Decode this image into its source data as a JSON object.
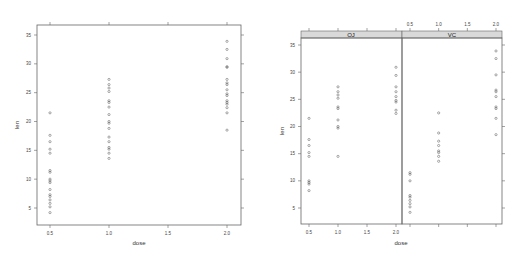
{
  "chart_data": [
    {
      "type": "scatter",
      "title": "",
      "xlabel": "dose",
      "ylabel": "len",
      "xlim": [
        0.4,
        2.1
      ],
      "ylim": [
        2.5,
        36
      ],
      "x_ticks": [
        "0.5",
        "1.0",
        "1.5",
        "2.0"
      ],
      "y_ticks": [
        "5",
        "10",
        "15",
        "20",
        "25",
        "30",
        "35"
      ],
      "grid": false,
      "series": [
        {
          "name": "all",
          "points": {
            "0.5": [
              4.2,
              5.2,
              5.8,
              6.4,
              7.0,
              7.3,
              8.2,
              9.4,
              9.7,
              10.0,
              11.2,
              11.5,
              14.5,
              15.2,
              16.5,
              17.6,
              21.5
            ],
            "1.0": [
              13.6,
              14.5,
              15.2,
              15.5,
              16.5,
              17.3,
              18.8,
              19.7,
              20.0,
              21.2,
              22.5,
              23.3,
              23.6,
              25.2,
              25.8,
              26.4,
              27.3
            ],
            "2.0": [
              18.5,
              21.5,
              22.4,
              23.0,
              23.3,
              23.6,
              24.5,
              24.8,
              25.5,
              26.4,
              26.7,
              27.3,
              29.4,
              29.5,
              30.9,
              32.5,
              33.9
            ]
          }
        }
      ]
    },
    {
      "type": "scatter",
      "title": "",
      "xlabel": "dose",
      "ylabel": "len",
      "xlim": [
        0.4,
        2.1
      ],
      "ylim": [
        2.5,
        36
      ],
      "x_ticks": [
        "0.5",
        "1.0",
        "1.5",
        "2.0"
      ],
      "y_ticks": [
        "5",
        "10",
        "15",
        "20",
        "25",
        "30",
        "35"
      ],
      "grid": false,
      "panels": [
        {
          "strip": "OJ",
          "points": {
            "0.5": [
              8.2,
              9.4,
              9.7,
              10.0,
              14.5,
              15.2,
              16.5,
              17.6,
              21.5
            ],
            "1.0": [
              14.5,
              19.7,
              20.0,
              21.2,
              23.3,
              23.6,
              25.2,
              25.8,
              26.4,
              27.3
            ],
            "2.0": [
              22.4,
              23.0,
              24.5,
              24.8,
              25.5,
              26.4,
              27.3,
              29.4,
              30.9
            ]
          }
        },
        {
          "strip": "VC",
          "points": {
            "0.5": [
              4.2,
              5.2,
              5.8,
              6.4,
              7.0,
              7.3,
              10.0,
              11.2,
              11.5
            ],
            "1.0": [
              13.6,
              14.5,
              15.2,
              15.5,
              16.5,
              17.3,
              18.8,
              22.5
            ],
            "2.0": [
              18.5,
              21.5,
              23.3,
              23.6,
              25.5,
              26.4,
              26.7,
              29.5,
              32.5,
              33.9
            ]
          }
        }
      ]
    }
  ],
  "left": {
    "xlabel": "dose",
    "ylabel": "len"
  },
  "right": {
    "xlabel": "dose",
    "ylabel": "len",
    "strip_left": "OJ",
    "strip_right": "VC"
  }
}
